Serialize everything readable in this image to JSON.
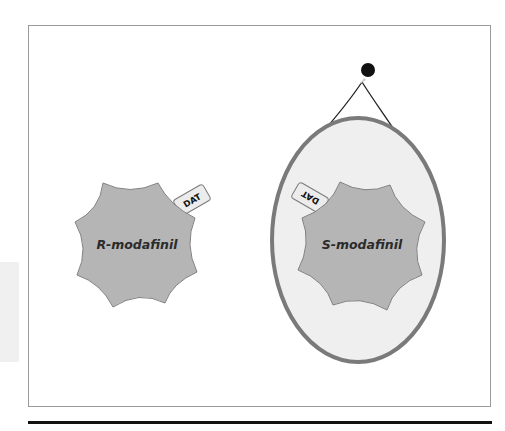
{
  "figure": {
    "type": "diagram",
    "colors": {
      "molecule_fill": "#b5b5b5",
      "molecule_stroke": "#808080",
      "oval_fill": "#efefef",
      "oval_stroke": "#7a7a7a",
      "tag_fill": "#ececec",
      "tag_stroke": "#7a7a7a",
      "nail": "#111111",
      "string": "#222222",
      "frame": "#9a9a9a",
      "rule": "#111111"
    }
  },
  "left_molecule": {
    "label": "R-modafinil",
    "tag": {
      "label": "DAT",
      "rotation_deg": -30
    }
  },
  "right_molecule": {
    "label": "S-modafinil",
    "tag": {
      "label": "DAT",
      "rotation_deg": 210
    },
    "container": {
      "shape": "oval",
      "hanging": true
    }
  }
}
